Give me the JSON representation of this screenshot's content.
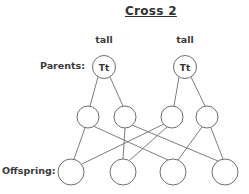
{
  "title": "Cross 2",
  "labels": {
    "parents": "Parents:",
    "offspring": "Offspring:"
  },
  "parents": [
    {
      "phenotype": "tall",
      "genotype": "Tt",
      "cx": 104,
      "cy": 67
    },
    {
      "phenotype": "tall",
      "genotype": "Tt",
      "cx": 185,
      "cy": 67
    }
  ],
  "gametes": [
    {
      "genotype": "",
      "cx": 88,
      "cy": 117
    },
    {
      "genotype": "",
      "cx": 125,
      "cy": 117
    },
    {
      "genotype": "",
      "cx": 172,
      "cy": 117
    },
    {
      "genotype": "",
      "cx": 207,
      "cy": 117
    }
  ],
  "offspring": [
    {
      "genotype": "",
      "cx": 71,
      "cy": 172
    },
    {
      "genotype": "",
      "cx": 123,
      "cy": 172
    },
    {
      "genotype": "",
      "cx": 173,
      "cy": 172
    },
    {
      "genotype": "",
      "cx": 225,
      "cy": 172
    }
  ],
  "colors": {
    "stroke": "#6e6e6e",
    "text": "#333333"
  }
}
